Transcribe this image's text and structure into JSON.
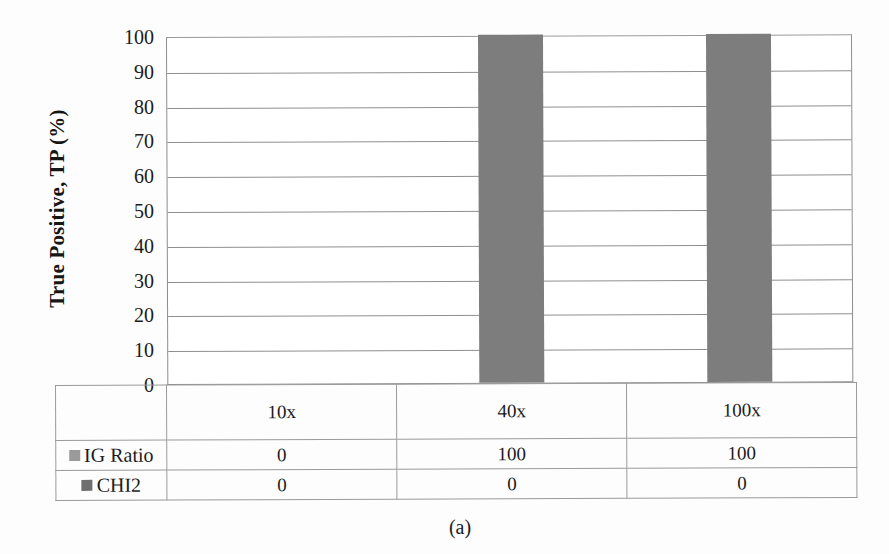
{
  "figure": {
    "caption": "(a)"
  },
  "chart_data": {
    "type": "bar",
    "title": "",
    "xlabel": "",
    "ylabel": "True Positive, TP (%)",
    "categories": [
      "10x",
      "40x",
      "100x"
    ],
    "series": [
      {
        "name": "IG Ratio",
        "values": [
          0,
          100,
          100
        ],
        "color": "#7d7d7d",
        "swatch_color": "#9a9a9a"
      },
      {
        "name": "CHI2",
        "values": [
          0,
          0,
          0
        ],
        "color": "#6b6b6b",
        "swatch_color": "#6f6f6f"
      }
    ],
    "ylim": [
      0,
      100
    ],
    "ytick_labels": [
      "100",
      "90",
      "80",
      "70",
      "60",
      "50",
      "40",
      "30",
      "20",
      "10",
      "0"
    ],
    "ytick_values": [
      100,
      90,
      80,
      70,
      60,
      50,
      40,
      30,
      20,
      10,
      0
    ],
    "grid": true,
    "legend_position": "data-table-left",
    "data_table_visible": true
  },
  "table": {
    "category_row": [
      "10x",
      "40x",
      "100x"
    ],
    "rows": [
      {
        "label": "IG Ratio",
        "values": [
          "0",
          "100",
          "100"
        ]
      },
      {
        "label": "CHI2",
        "values": [
          "0",
          "0",
          "0"
        ]
      }
    ]
  }
}
